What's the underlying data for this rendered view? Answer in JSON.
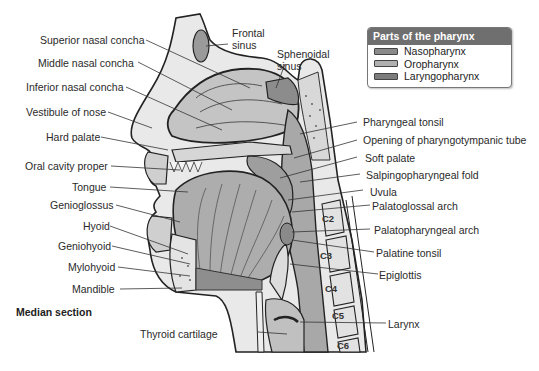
{
  "legend": {
    "title": "Parts of the pharynx",
    "items": [
      {
        "label": "Nasopharynx",
        "color": "#8a8a8a"
      },
      {
        "label": "Oropharynx",
        "color": "#b0b0b0"
      },
      {
        "label": "Laryngopharynx",
        "color": "#7c7c7c"
      }
    ]
  },
  "caption": "Median section",
  "labels": {
    "left": [
      "Superior nasal concha",
      "Middle nasal concha",
      "Inferior nasal concha",
      "Vestibule of nose",
      "Hard palate",
      "Oral cavity proper",
      "Tongue",
      "Genioglossus",
      "Hyoid",
      "Geniohyoid",
      "Mylohyoid",
      "Mandible"
    ],
    "top": [
      "Frontal sinus",
      "Sphenoidal sinus"
    ],
    "right": [
      "Pharyngeal tonsil",
      "Opening of pharyngotympanic tube",
      "Soft palate",
      "Salpingopharyngeal fold",
      "Uvula",
      "Palatoglossal arch",
      "Palatopharyngeal arch",
      "Palatine tonsil",
      "Epiglottis",
      "Larynx"
    ],
    "bottom": [
      "Thyroid cartilage"
    ]
  },
  "vertebrae": [
    "C2",
    "C3",
    "C4",
    "C5",
    "C6"
  ]
}
